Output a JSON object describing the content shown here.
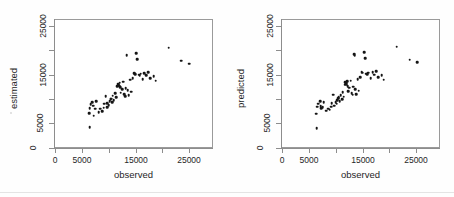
{
  "figure": {
    "background": "#ffffff",
    "point_color": "#151515",
    "axis_color": "#8d8d8d"
  },
  "chart_data": [
    {
      "type": "scatter",
      "title": "",
      "xlabel": "observed",
      "ylabel": "estimated",
      "xlim": [
        0,
        26500
      ],
      "ylim": [
        0,
        26500
      ],
      "xticks": [
        0,
        5000,
        10000,
        15000,
        20000,
        25000
      ],
      "xticklabels": [
        "0",
        "5000",
        "",
        "15000",
        "",
        "25000"
      ],
      "yticks": [
        0,
        5000,
        10000,
        15000,
        20000,
        25000
      ],
      "yticklabels": [
        "0",
        "5000",
        "",
        "15000",
        "",
        "25000"
      ],
      "grid": false,
      "legend": null,
      "points": [
        [
          6300,
          4200
        ],
        [
          6200,
          7100
        ],
        [
          6250,
          8100
        ],
        [
          6500,
          8900
        ],
        [
          6800,
          9400
        ],
        [
          6900,
          8600
        ],
        [
          7000,
          6600
        ],
        [
          7300,
          8000
        ],
        [
          7500,
          9500
        ],
        [
          8000,
          7300
        ],
        [
          8300,
          8000
        ],
        [
          8600,
          7500
        ],
        [
          8900,
          8200
        ],
        [
          9000,
          9000
        ],
        [
          9300,
          10600
        ],
        [
          9500,
          8300
        ],
        [
          9600,
          9200
        ],
        [
          9800,
          8700
        ],
        [
          10000,
          9600
        ],
        [
          10200,
          9900
        ],
        [
          10300,
          10100
        ],
        [
          10500,
          9300
        ],
        [
          10600,
          10700
        ],
        [
          10800,
          9800
        ],
        [
          11000,
          11200
        ],
        [
          11200,
          10400
        ],
        [
          11400,
          12600
        ],
        [
          11500,
          13100
        ],
        [
          11600,
          12800
        ],
        [
          11700,
          13000
        ],
        [
          11800,
          12700
        ],
        [
          11900,
          13300
        ],
        [
          12000,
          12400
        ],
        [
          12100,
          11300
        ],
        [
          12300,
          12000
        ],
        [
          12500,
          13500
        ],
        [
          12700,
          11000
        ],
        [
          12900,
          10600
        ],
        [
          13000,
          12200
        ],
        [
          13200,
          18900
        ],
        [
          13400,
          11800
        ],
        [
          13600,
          10800
        ],
        [
          13800,
          13900
        ],
        [
          14000,
          11500
        ],
        [
          14300,
          14200
        ],
        [
          14600,
          15300
        ],
        [
          14800,
          15100
        ],
        [
          15000,
          19400
        ],
        [
          15200,
          18100
        ],
        [
          15400,
          15000
        ],
        [
          15600,
          14900
        ],
        [
          15800,
          15200
        ],
        [
          16200,
          14100
        ],
        [
          16500,
          15300
        ],
        [
          16800,
          14800
        ],
        [
          17200,
          15500
        ],
        [
          17600,
          14300
        ],
        [
          18200,
          14600
        ],
        [
          18600,
          13700
        ],
        [
          21000,
          20500
        ],
        [
          23400,
          17800
        ],
        [
          24900,
          17200
        ]
      ]
    },
    {
      "type": "scatter",
      "title": "",
      "xlabel": "observed",
      "ylabel": "predicted",
      "xlim": [
        0,
        26500
      ],
      "ylim": [
        0,
        26500
      ],
      "xticks": [
        0,
        5000,
        10000,
        15000,
        20000,
        25000
      ],
      "xticklabels": [
        "0",
        "5000",
        "",
        "15000",
        "",
        "25000"
      ],
      "yticks": [
        0,
        5000,
        10000,
        15000,
        20000,
        25000
      ],
      "yticklabels": [
        "0",
        "5000",
        "",
        "15000",
        "",
        "25000"
      ],
      "grid": false,
      "legend": null,
      "points": [
        [
          6300,
          4100
        ],
        [
          6200,
          7000
        ],
        [
          6350,
          8400
        ],
        [
          6600,
          9000
        ],
        [
          6900,
          9600
        ],
        [
          7000,
          8500
        ],
        [
          7100,
          8100
        ],
        [
          7400,
          8300
        ],
        [
          7600,
          9400
        ],
        [
          8100,
          7600
        ],
        [
          8400,
          8000
        ],
        [
          8700,
          7800
        ],
        [
          9000,
          8400
        ],
        [
          9100,
          9100
        ],
        [
          9400,
          10900
        ],
        [
          9600,
          8600
        ],
        [
          9800,
          9300
        ],
        [
          10000,
          9000
        ],
        [
          10100,
          9800
        ],
        [
          10300,
          10200
        ],
        [
          10400,
          10400
        ],
        [
          10600,
          9500
        ],
        [
          10800,
          10800
        ],
        [
          11000,
          10000
        ],
        [
          11100,
          11400
        ],
        [
          11300,
          10500
        ],
        [
          11500,
          12900
        ],
        [
          11600,
          13400
        ],
        [
          11700,
          13000
        ],
        [
          11800,
          13200
        ],
        [
          11900,
          12900
        ],
        [
          12000,
          13600
        ],
        [
          12100,
          12600
        ],
        [
          12200,
          11600
        ],
        [
          12400,
          12300
        ],
        [
          12600,
          13700
        ],
        [
          12800,
          11200
        ],
        [
          13000,
          10900
        ],
        [
          13100,
          12500
        ],
        [
          13300,
          19200
        ],
        [
          13400,
          18800
        ],
        [
          13500,
          12000
        ],
        [
          13700,
          11000
        ],
        [
          13900,
          14100
        ],
        [
          14100,
          11700
        ],
        [
          14400,
          14400
        ],
        [
          14700,
          15500
        ],
        [
          14900,
          15400
        ],
        [
          15100,
          19600
        ],
        [
          15300,
          18300
        ],
        [
          15500,
          15200
        ],
        [
          15700,
          15100
        ],
        [
          15900,
          15400
        ],
        [
          16400,
          14300
        ],
        [
          16700,
          15500
        ],
        [
          17000,
          15000
        ],
        [
          17400,
          15700
        ],
        [
          17800,
          14500
        ],
        [
          18400,
          14800
        ],
        [
          18800,
          13900
        ],
        [
          21200,
          20700
        ],
        [
          23600,
          18000
        ],
        [
          25000,
          17500
        ]
      ]
    }
  ],
  "panels": [
    {
      "name": "estimated-vs-observed",
      "y_axis_title": "estimated",
      "x_axis_title": "observed",
      "x_tick_labels": [
        "0",
        "5000",
        "15000",
        "25000"
      ],
      "y_tick_labels": [
        "0",
        "5000",
        "15000",
        "25000"
      ]
    },
    {
      "name": "predicted-vs-observed",
      "y_axis_title": "predicted",
      "x_axis_title": "observed",
      "x_tick_labels": [
        "0",
        "5000",
        "15000",
        "25000"
      ],
      "y_tick_labels": [
        "0",
        "5000",
        "15000",
        "25000"
      ]
    }
  ]
}
